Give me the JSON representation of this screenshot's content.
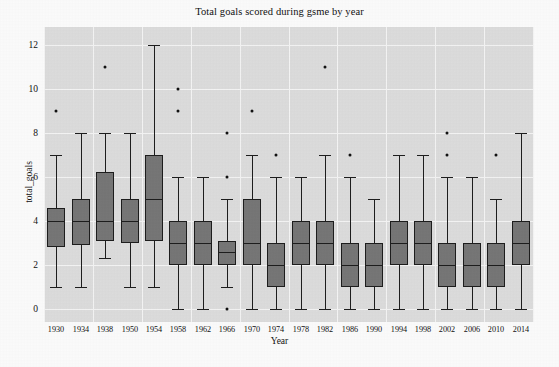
{
  "chart_data": {
    "type": "box",
    "title": "Total goals scored during gsme by year",
    "xlabel": "Year",
    "ylabel": "total_goals",
    "ylim": [
      -0.6,
      12.8
    ],
    "yticks": [
      0,
      2,
      4,
      6,
      8,
      10,
      12
    ],
    "ytick_labels": [
      "0",
      "2",
      "4",
      "6",
      "8",
      "10",
      "12"
    ],
    "grid": true,
    "categories": [
      "1930",
      "1934",
      "1938",
      "1950",
      "1954",
      "1958",
      "1962",
      "1966",
      "1970",
      "1974",
      "1978",
      "1982",
      "1986",
      "1990",
      "1994",
      "1998",
      "2002",
      "2006",
      "2010",
      "2014"
    ],
    "boxes": [
      {
        "category": "1930",
        "whisker_low": 1.0,
        "q1": 2.8,
        "median": 4.0,
        "q3": 4.6,
        "whisker_high": 7.0,
        "fliers": [
          9.0
        ]
      },
      {
        "category": "1934",
        "whisker_low": 1.0,
        "q1": 2.9,
        "median": 4.0,
        "q3": 5.0,
        "whisker_high": 8.0,
        "fliers": []
      },
      {
        "category": "1938",
        "whisker_low": 2.3,
        "q1": 3.1,
        "median": 4.0,
        "q3": 6.2,
        "whisker_high": 8.0,
        "fliers": [
          11.0
        ]
      },
      {
        "category": "1950",
        "whisker_low": 1.0,
        "q1": 3.0,
        "median": 4.0,
        "q3": 5.0,
        "whisker_high": 8.0,
        "fliers": []
      },
      {
        "category": "1954",
        "whisker_low": 1.0,
        "q1": 3.1,
        "median": 5.0,
        "q3": 7.0,
        "whisker_high": 12.0,
        "fliers": []
      },
      {
        "category": "1958",
        "whisker_low": 0.0,
        "q1": 2.0,
        "median": 3.0,
        "q3": 4.0,
        "whisker_high": 6.0,
        "fliers": [
          9.0,
          10.0
        ]
      },
      {
        "category": "1962",
        "whisker_low": 0.0,
        "q1": 2.0,
        "median": 3.0,
        "q3": 4.0,
        "whisker_high": 6.0,
        "fliers": []
      },
      {
        "category": "1966",
        "whisker_low": 1.0,
        "q1": 2.0,
        "median": 2.6,
        "q3": 3.1,
        "whisker_high": 5.0,
        "fliers": [
          0.0,
          6.0,
          8.0
        ]
      },
      {
        "category": "1970",
        "whisker_low": 0.0,
        "q1": 2.0,
        "median": 3.0,
        "q3": 5.0,
        "whisker_high": 7.0,
        "fliers": [
          9.0
        ]
      },
      {
        "category": "1974",
        "whisker_low": 0.0,
        "q1": 1.0,
        "median": 2.0,
        "q3": 3.0,
        "whisker_high": 6.0,
        "fliers": [
          7.0
        ]
      },
      {
        "category": "1978",
        "whisker_low": 0.0,
        "q1": 2.0,
        "median": 3.0,
        "q3": 4.0,
        "whisker_high": 6.0,
        "fliers": []
      },
      {
        "category": "1982",
        "whisker_low": 0.0,
        "q1": 2.0,
        "median": 3.0,
        "q3": 4.0,
        "whisker_high": 7.0,
        "fliers": [
          11.0
        ]
      },
      {
        "category": "1986",
        "whisker_low": 0.0,
        "q1": 1.0,
        "median": 2.0,
        "q3": 3.0,
        "whisker_high": 6.0,
        "fliers": [
          7.0
        ]
      },
      {
        "category": "1990",
        "whisker_low": 0.0,
        "q1": 1.0,
        "median": 2.0,
        "q3": 3.0,
        "whisker_high": 5.0,
        "fliers": []
      },
      {
        "category": "1994",
        "whisker_low": 0.0,
        "q1": 2.0,
        "median": 3.0,
        "q3": 4.0,
        "whisker_high": 7.0,
        "fliers": []
      },
      {
        "category": "1998",
        "whisker_low": 0.0,
        "q1": 2.0,
        "median": 3.0,
        "q3": 4.0,
        "whisker_high": 7.0,
        "fliers": []
      },
      {
        "category": "2002",
        "whisker_low": 0.0,
        "q1": 1.0,
        "median": 2.0,
        "q3": 3.0,
        "whisker_high": 6.0,
        "fliers": [
          7.0,
          8.0
        ]
      },
      {
        "category": "2006",
        "whisker_low": 0.0,
        "q1": 1.0,
        "median": 2.0,
        "q3": 3.0,
        "whisker_high": 6.0,
        "fliers": []
      },
      {
        "category": "2010",
        "whisker_low": 0.0,
        "q1": 1.0,
        "median": 2.0,
        "q3": 3.0,
        "whisker_high": 5.0,
        "fliers": [
          7.0
        ]
      },
      {
        "category": "2014",
        "whisker_low": 0.0,
        "q1": 2.0,
        "median": 3.0,
        "q3": 4.0,
        "whisker_high": 8.0,
        "fliers": []
      }
    ],
    "colors": {
      "box_fill": "#767676",
      "box_edge": "#1d1d1d",
      "plot_background": "#dcdcdc",
      "grid": "#f4f4f4",
      "text": "#111111"
    }
  }
}
